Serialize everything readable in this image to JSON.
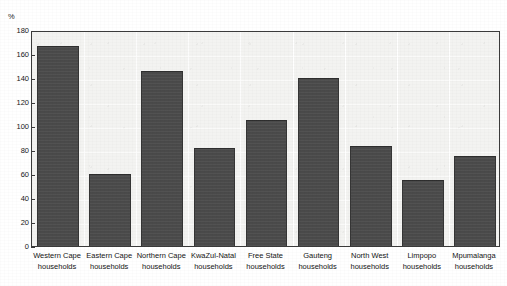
{
  "chart_data": {
    "type": "bar",
    "title": "",
    "subtitle": "",
    "unit_label": "%",
    "xlabel": "",
    "ylabel": "%",
    "ylim": [
      0,
      180
    ],
    "ytick_step": 20,
    "grid": true,
    "legend": "none",
    "bar_color": "#4a4a4a",
    "plot_bg_color": "#f3f3f1",
    "axis_color": "#3b3b3b",
    "categories": [
      "Western Cape households",
      "Eastern Cape households",
      "Northern Cape households",
      "KwaZul-Natal households",
      "Free State households",
      "Gauteng households",
      "North West households",
      "Limpopo households",
      "Mpumalanga households"
    ],
    "category_lines": [
      [
        "Western Cape",
        "households"
      ],
      [
        "Eastern Cape",
        "households"
      ],
      [
        "Northern Cape",
        "households"
      ],
      [
        "KwaZul-Natal",
        "households"
      ],
      [
        "Free State",
        "households"
      ],
      [
        "Gauteng",
        "households"
      ],
      [
        "North West",
        "households"
      ],
      [
        "Limpopo",
        "households"
      ],
      [
        "Mpumalanga",
        "households"
      ]
    ],
    "values": [
      167,
      60,
      146,
      82,
      105,
      140,
      83,
      55,
      75
    ],
    "ytick_labels": [
      "180",
      "160",
      "140",
      "120",
      "100",
      "80",
      "60",
      "40",
      "20",
      "0"
    ],
    "ytick_values": [
      180,
      160,
      140,
      120,
      100,
      80,
      60,
      40,
      20,
      0
    ]
  }
}
